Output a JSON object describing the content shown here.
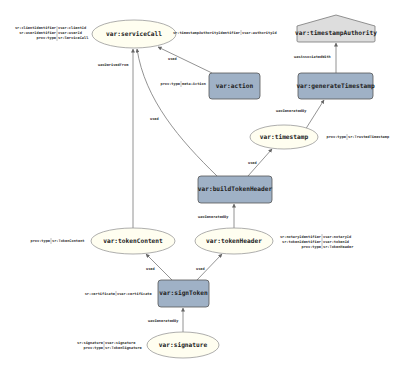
{
  "diagram": {
    "type": "provenance-graph",
    "nodes": {
      "serviceCall": {
        "label": "var:serviceCall",
        "kind": "entity"
      },
      "timestampAuthority": {
        "label": "var:timestampAuthority",
        "kind": "agent"
      },
      "action": {
        "label": "var:action",
        "kind": "activity"
      },
      "generateTimestamp": {
        "label": "var:generateTimestamp",
        "kind": "activity"
      },
      "timestamp": {
        "label": "var:timestamp",
        "kind": "entity"
      },
      "buildTokenHeader": {
        "label": "var:buildTokenHeader",
        "kind": "activity"
      },
      "tokenContent": {
        "label": "var:tokenContent",
        "kind": "entity"
      },
      "tokenHeader": {
        "label": "var:tokenHeader",
        "kind": "entity"
      },
      "signToken": {
        "label": "var:signToken",
        "kind": "activity"
      },
      "signature": {
        "label": "var:signature",
        "kind": "entity"
      }
    },
    "edges": {
      "e1": {
        "from": "action",
        "to": "serviceCall",
        "label": "used"
      },
      "e2": {
        "from": "tokenContent",
        "to": "serviceCall",
        "label": "wasDerivedFrom"
      },
      "e3": {
        "from": "buildTokenHeader",
        "to": "serviceCall",
        "label": "used"
      },
      "e4": {
        "from": "generateTimestamp",
        "to": "timestampAuthority",
        "label": "wasAssociatedWith"
      },
      "e5": {
        "from": "timestamp",
        "to": "generateTimestamp",
        "label": "wasGeneratedBy"
      },
      "e6": {
        "from": "buildTokenHeader",
        "to": "timestamp",
        "label": "used"
      },
      "e7": {
        "from": "tokenHeader",
        "to": "buildTokenHeader",
        "label": "wasGeneratedBy"
      },
      "e8": {
        "from": "signToken",
        "to": "tokenContent",
        "label": "used"
      },
      "e9": {
        "from": "signToken",
        "to": "tokenHeader",
        "label": "used"
      },
      "e10": {
        "from": "signature",
        "to": "signToken",
        "label": "wasGeneratedBy"
      }
    },
    "attributes": {
      "serviceCall": [
        {
          "key": "sr:clientIdentifier",
          "value": "vvar:clientId"
        },
        {
          "key": "sr:userIdentifier",
          "value": "vvar:userId"
        },
        {
          "key": "prov:type",
          "value": "sr:ServiceCall"
        }
      ],
      "timestampAuthority": [
        {
          "key": "sr:timestampAuthorityIdentifier",
          "value": "vvar:authorityId"
        }
      ],
      "action": [
        {
          "key": "prov:type",
          "value": "meta:Action"
        }
      ],
      "timestamp": [
        {
          "key": "prov:type",
          "value": "sr:TrustedTimestamp"
        }
      ],
      "tokenContent": [
        {
          "key": "prov:type",
          "value": "sr:TokenContent"
        }
      ],
      "tokenHeader": [
        {
          "key": "sr:notaryIdentifier",
          "value": "vvar:notaryId"
        },
        {
          "key": "sr:tokenIdentifier",
          "value": "vvar:tokenId"
        },
        {
          "key": "prov:type",
          "value": "sr:TokenHeader"
        }
      ],
      "signToken": [
        {
          "key": "sr:certificate",
          "value": "vvar:certificate"
        }
      ],
      "signature": [
        {
          "key": "sr:signature",
          "value": "vvar:signature"
        },
        {
          "key": "prov:type",
          "value": "sr:TokenSignature"
        }
      ]
    },
    "colors": {
      "entity_fill": "#fffef0",
      "entity_stroke": "#999999",
      "activity_fill": "#9fb1c6",
      "activity_stroke": "#555555",
      "agent_fill": "#dddddd",
      "edge": "#666666"
    }
  }
}
